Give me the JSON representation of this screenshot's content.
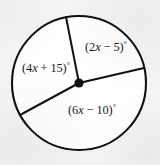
{
  "figure": {
    "name": "circle-with-three-central-angles",
    "type": "geometry-diagram",
    "background_color": "#f4f4f2",
    "stroke_color": "#111111"
  },
  "circle": {
    "center_x": 79,
    "center_y": 83,
    "radius": 67,
    "stroke_width": 2.1
  },
  "center_point": {
    "label": "center-dot",
    "radius": 4.6
  },
  "radii": [
    {
      "name": "radius-upper",
      "angle_deg": 101,
      "end_x": 66,
      "end_y": 17
    },
    {
      "name": "radius-right",
      "angle_deg": 13,
      "end_x": 144,
      "end_y": 68
    },
    {
      "name": "radius-lower-left",
      "angle_deg": 209,
      "end_x": 20,
      "end_y": 115
    }
  ],
  "labels": {
    "upper_right": {
      "text": "(2x − 5)°",
      "prefix": "(2",
      "variable": "x",
      "suffix": " − 5)",
      "degree": "°",
      "x": 85,
      "y": 51
    },
    "left": {
      "text": "(4x + 15)°",
      "prefix": "(4",
      "variable": "x",
      "suffix": " + 15)",
      "degree": "°",
      "x": 22,
      "y": 72
    },
    "bottom": {
      "text": "(6x − 10)°",
      "prefix": "(6",
      "variable": "x",
      "suffix": " − 10)",
      "degree": "°",
      "x": 68,
      "y": 114
    }
  }
}
